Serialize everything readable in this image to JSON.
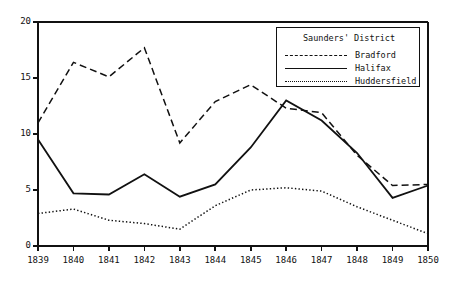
{
  "chart_data": {
    "type": "line",
    "title": "",
    "xlabel": "",
    "ylabel": "",
    "categories": [
      "1839",
      "1840",
      "1841",
      "1842",
      "1843",
      "1844",
      "1845",
      "1846",
      "1847",
      "1848",
      "1849",
      "1850"
    ],
    "x": [
      1839,
      1840,
      1841,
      1842,
      1843,
      1844,
      1845,
      1846,
      1847,
      1848,
      1849,
      1850
    ],
    "xlim": [
      1839,
      1850
    ],
    "ylim": [
      0,
      20
    ],
    "yticks": [
      0,
      5,
      10,
      15,
      20
    ],
    "ytick_labels": [
      "0",
      "5",
      "10",
      "15",
      "20"
    ],
    "grid": false,
    "legend_position": "top-right",
    "legend_title": "Saunders' District",
    "series": [
      {
        "name": "Bradford",
        "style": "dashed",
        "color": "#111111",
        "values": [
          11.0,
          16.4,
          15.1,
          17.7,
          9.2,
          12.9,
          14.4,
          12.3,
          11.9,
          8.1,
          5.4,
          5.5
        ]
      },
      {
        "name": "Halifax",
        "style": "solid",
        "color": "#111111",
        "values": [
          9.5,
          4.7,
          4.6,
          6.4,
          4.4,
          5.5,
          8.8,
          13.0,
          11.2,
          8.3,
          4.3,
          5.4
        ]
      },
      {
        "name": "Huddersfield",
        "style": "dotted",
        "color": "#111111",
        "values": [
          2.9,
          3.3,
          2.3,
          2.0,
          1.5,
          3.6,
          5.0,
          5.2,
          4.9,
          3.5,
          2.3,
          1.1
        ]
      }
    ]
  },
  "axes": {
    "y_tick_labels": [
      "20",
      "15",
      "10",
      "5",
      "0"
    ],
    "x_tick_labels": [
      "1839",
      "1840",
      "1841",
      "1842",
      "1843",
      "1844",
      "1845",
      "1846",
      "1847",
      "1848",
      "1849",
      "1850"
    ]
  },
  "legend": {
    "title": "Saunders' District",
    "entries": [
      {
        "label": "Bradford",
        "style": "dashed"
      },
      {
        "label": "Halifax",
        "style": "solid"
      },
      {
        "label": "Huddersfield",
        "style": "dotted"
      }
    ]
  }
}
